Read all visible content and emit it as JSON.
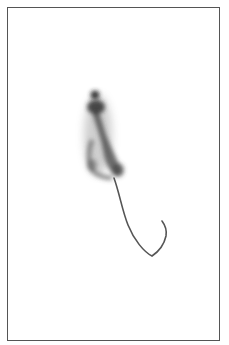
{
  "image": {
    "subject": "mouse viewed from above with long curved tail",
    "style": "grayscale photograph",
    "background_color": "#ffffff",
    "border_color": "#555555",
    "subject_color": "#3a3a3a"
  }
}
